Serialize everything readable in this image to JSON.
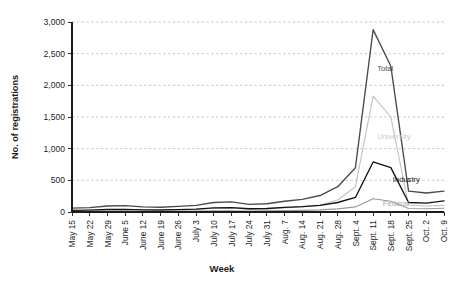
{
  "chart_data": {
    "type": "line",
    "title": "",
    "xlabel": "Week",
    "ylabel": "No. of registrations",
    "ylim": [
      0,
      3000
    ],
    "yticks": [
      "0",
      "500",
      "1,000",
      "1,500",
      "2,000",
      "2,500",
      "3,000"
    ],
    "ytick_values": [
      0,
      500,
      1000,
      1500,
      2000,
      2500,
      3000
    ],
    "grid": "horizontal-dashed",
    "legend_position": "inline-labels",
    "categories": [
      "May 15",
      "May 22",
      "May 29",
      "June 5",
      "June 12",
      "June 19",
      "June 26",
      "July 3",
      "July 10",
      "July 17",
      "July 24",
      "July 31",
      "Aug. 7",
      "Aug. 14",
      "Aug. 21",
      "Aug. 28",
      "Sept. 4",
      "Sept. 11",
      "Sept. 18",
      "Sept. 25",
      "Oct. 2",
      "Oct. 9"
    ],
    "series": [
      {
        "name": "Total",
        "color": "#4a4a4a",
        "values": [
          60,
          70,
          95,
          100,
          80,
          75,
          90,
          105,
          150,
          160,
          120,
          130,
          170,
          200,
          260,
          400,
          700,
          2880,
          2300,
          330,
          300,
          330
        ]
      },
      {
        "name": "University",
        "color": "#c2c2c2",
        "values": [
          20,
          25,
          35,
          40,
          30,
          28,
          32,
          40,
          60,
          65,
          45,
          50,
          65,
          80,
          110,
          190,
          400,
          1830,
          1500,
          110,
          95,
          105
        ]
      },
      {
        "name": "Industry",
        "color": "#111111",
        "values": [
          25,
          30,
          40,
          42,
          34,
          32,
          38,
          45,
          65,
          70,
          52,
          55,
          72,
          85,
          105,
          150,
          230,
          790,
          700,
          150,
          140,
          175
        ]
      },
      {
        "name": "Federal",
        "color": "#9a9a9a",
        "values": [
          8,
          10,
          12,
          14,
          11,
          10,
          12,
          14,
          18,
          20,
          16,
          17,
          22,
          26,
          34,
          50,
          80,
          210,
          170,
          55,
          52,
          60
        ]
      }
    ],
    "annotations": [
      {
        "text": "Total",
        "x_index": 17,
        "value": 2230,
        "color": "#4a4a4a",
        "dx": 4,
        "dy": 0
      },
      {
        "text": "University",
        "x_index": 17,
        "value": 1150,
        "color": "#c9c9c9",
        "dx": 4,
        "dy": 0
      },
      {
        "text": "Industry",
        "x_index": 18,
        "value": 470,
        "color": "#111111",
        "dx": 2,
        "dy": 0
      },
      {
        "text": "Federal",
        "x_index": 18,
        "value": 95,
        "color": "#a8a8a8",
        "dx": -8,
        "dy": 0
      }
    ],
    "style": {
      "grid_color": "#b9b9b9",
      "axis_color": "#1b1b1b",
      "background": "#ffffff"
    }
  }
}
